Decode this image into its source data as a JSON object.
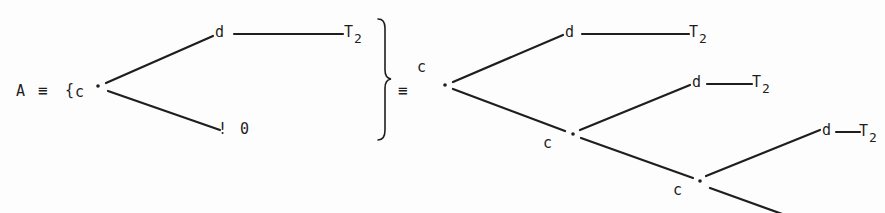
{
  "diagram": {
    "lhs": {
      "name": "A",
      "equiv": "≡",
      "open_brace": "{",
      "root_label": "c",
      "upper_branch": {
        "label": "d",
        "target": "T",
        "target_sub": "2"
      },
      "lower_branch": {
        "label": "!",
        "target": "0"
      }
    },
    "close_brace": "}",
    "equiv": "≡",
    "rhs": {
      "root_label": "c",
      "levels": [
        {
          "node": "c",
          "branch": {
            "label": "d",
            "target": "T",
            "target_sub": "2"
          }
        },
        {
          "node": "c",
          "branch": {
            "label": "d",
            "target": "T",
            "target_sub": "2"
          }
        },
        {
          "node": "c",
          "branch": {
            "label": "d",
            "target": "T",
            "target_sub": "2"
          }
        }
      ]
    },
    "colors": {
      "ink": "#1e1e1e",
      "paper": "#fdfdfd"
    }
  }
}
